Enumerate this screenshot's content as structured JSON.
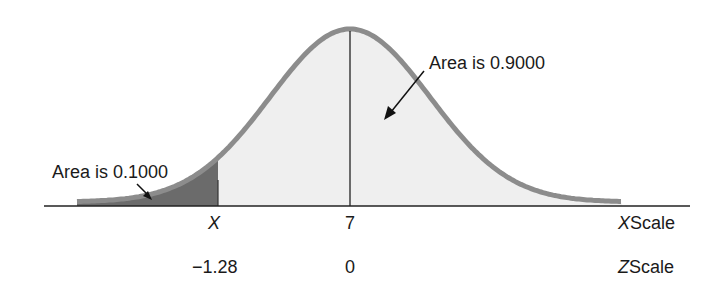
{
  "diagram": {
    "type": "normal-distribution",
    "mean_label": "7",
    "shaded_tail": {
      "label": "Area is 0.1000",
      "color": "#6b6b6b"
    },
    "body_region": {
      "label": "Area is 0.9000",
      "color": "#efefef"
    },
    "curve_color": "#8c8c8c",
    "x_axis": {
      "ticks": [
        {
          "label": "X",
          "italic": true
        },
        {
          "label": "7",
          "italic": false
        }
      ],
      "scale_label_var": "X",
      "scale_label_word": "Scale"
    },
    "z_axis": {
      "ticks": [
        {
          "label": "−1.28"
        },
        {
          "label": "0"
        }
      ],
      "scale_label_var": "Z",
      "scale_label_word": "Scale"
    }
  }
}
